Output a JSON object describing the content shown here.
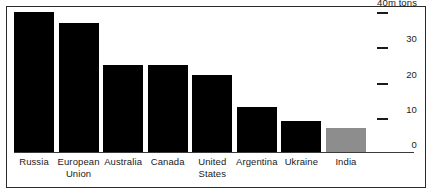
{
  "chart_data": {
    "type": "bar",
    "title": "",
    "subtitle": "",
    "xlabel": "",
    "ylabel": "40m tons",
    "unit_label": "40m tons",
    "ylim": [
      0,
      40
    ],
    "grid": false,
    "legend": null,
    "categories": [
      "Russia",
      "European Union",
      "Australia",
      "Canada",
      "United States",
      "Argentina",
      "Ukraine",
      "India"
    ],
    "category_lines": [
      [
        "Russia",
        ""
      ],
      [
        "European",
        "Union"
      ],
      [
        "Australia",
        ""
      ],
      [
        "Canada",
        ""
      ],
      [
        "United",
        "States"
      ],
      [
        "Argentina",
        ""
      ],
      [
        "Ukraine",
        ""
      ],
      [
        "India",
        ""
      ]
    ],
    "values": [
      40,
      37,
      25,
      25,
      22,
      13,
      9,
      7
    ],
    "bar_colors": [
      "#000000",
      "#000000",
      "#000000",
      "#000000",
      "#000000",
      "#000000",
      "#000000",
      "#8d8d8d"
    ],
    "highlighted_category": "India",
    "axis": {
      "ticks": [
        {
          "value": 40,
          "label": "40m tons"
        },
        {
          "value": 30,
          "label": "30"
        },
        {
          "value": 20,
          "label": "20"
        },
        {
          "value": 10,
          "label": "10"
        },
        {
          "value": 0,
          "label": "0"
        }
      ],
      "position": "right"
    }
  },
  "colors": {
    "bar_primary": "#000000",
    "bar_highlight": "#8d8d8d",
    "frame": "#2b2b2b",
    "text": "#1a1a1a",
    "background": "#ffffff"
  }
}
